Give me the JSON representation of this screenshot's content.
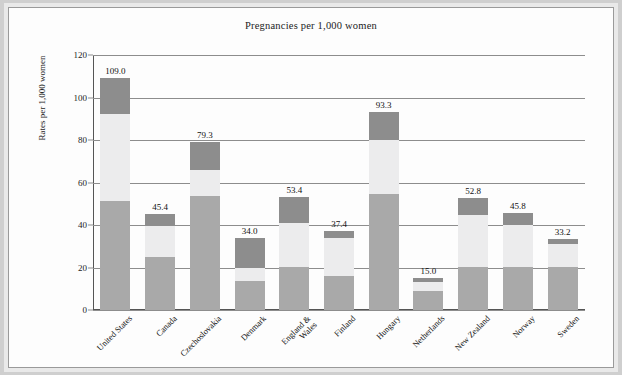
{
  "chart_data": {
    "type": "bar",
    "stacked": true,
    "title": "Pregnancies per 1,000 women",
    "xlabel": "",
    "ylabel": "Rates per 1,000 women",
    "ylim": [
      0,
      120
    ],
    "yticks": [
      0,
      20,
      40,
      60,
      80,
      100,
      120
    ],
    "ytick_labels": [
      "0",
      "20",
      "40",
      "60",
      "80",
      "100",
      "120"
    ],
    "grid": "horizontal",
    "legend": "none",
    "categories": [
      "United States",
      "Canada",
      "Czechoslovakia",
      "Denmark",
      "England &\nWales",
      "Finland",
      "Hungary",
      "Netherlands",
      "New Zealand",
      "Norway",
      "Sweden"
    ],
    "series": [
      {
        "name": "segment-bottom",
        "color": "#a9a9a9",
        "values": [
          51.5,
          25.0,
          53.5,
          13.5,
          20.3,
          15.8,
          54.7,
          8.9,
          20.3,
          20.3,
          20.3
        ]
      },
      {
        "name": "segment-middle",
        "color": "#ececed",
        "values": [
          40.8,
          14.7,
          12.6,
          6.5,
          20.6,
          18.3,
          25.3,
          4.1,
          24.4,
          19.5,
          11.0
        ]
      },
      {
        "name": "segment-top",
        "color": "#8d8d8d",
        "values": [
          16.7,
          5.7,
          13.2,
          14.0,
          12.5,
          3.3,
          13.3,
          2.0,
          8.1,
          6.0,
          1.9
        ]
      }
    ],
    "totals": [
      109.0,
      45.4,
      79.3,
      34.0,
      53.4,
      37.4,
      93.3,
      15.0,
      52.8,
      45.8,
      33.2
    ],
    "total_labels": [
      "109.0",
      "45.4",
      "79.3",
      "34.0",
      "53.4",
      "37.4",
      "93.3",
      "15.0",
      "52.8",
      "45.8",
      "33.2"
    ]
  },
  "colors": {
    "background": "#cfcfcf",
    "panel": "#fdfdfd",
    "frame_border": "#9a9a9a",
    "gridline": "#8d8d8d",
    "text": "#1c1c1c"
  }
}
